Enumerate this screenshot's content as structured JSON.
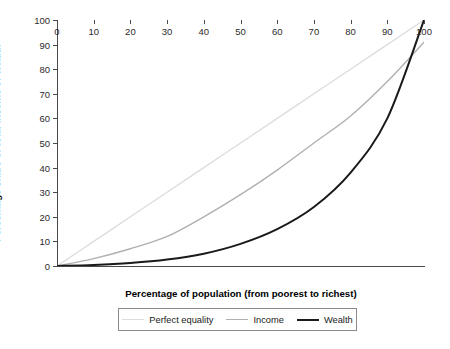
{
  "chart_data": {
    "type": "line",
    "title": "",
    "xlabel": "Percentage of population (from poorest to richest)",
    "ylabel": "Percentage share of total income or wealth",
    "xlim": [
      0,
      100
    ],
    "ylim": [
      0,
      100
    ],
    "xticks": [
      0,
      10,
      20,
      30,
      40,
      50,
      60,
      70,
      80,
      90,
      100
    ],
    "yticks": [
      0,
      10,
      20,
      30,
      40,
      50,
      60,
      70,
      80,
      90,
      100
    ],
    "grid": false,
    "legend_position": "below-axes",
    "x": [
      0,
      10,
      20,
      30,
      40,
      50,
      60,
      70,
      80,
      90,
      100
    ],
    "series": [
      {
        "name": "Perfect equality",
        "color": "#dcdcdc",
        "width": 1.3,
        "values": [
          0,
          10,
          20,
          30,
          40,
          50,
          60,
          70,
          80,
          90,
          100
        ]
      },
      {
        "name": "Income",
        "color": "#b0b0b0",
        "width": 1.4,
        "values": [
          0,
          3,
          7,
          12,
          20,
          29,
          39,
          50,
          61,
          75,
          91
        ]
      },
      {
        "name": "Wealth",
        "color": "#1a1a1a",
        "width": 2.0,
        "values": [
          0,
          0.4,
          1.2,
          2.6,
          5,
          9,
          15,
          24,
          38,
          60,
          100
        ]
      }
    ]
  },
  "axes": {
    "ylabel": "Percentage share of total income or wealth",
    "xlabel": "Percentage of population (from poorest to richest)",
    "ytick_labels": [
      "0",
      "10",
      "20",
      "30",
      "40",
      "50",
      "60",
      "70",
      "80",
      "90",
      "100"
    ],
    "xtick_labels": [
      "0",
      "10",
      "20",
      "30",
      "40",
      "50",
      "60",
      "70",
      "80",
      "90",
      "100"
    ]
  },
  "legend": {
    "items": [
      {
        "label": "Perfect equality",
        "color": "#dcdcdc",
        "thickness": "1.3px"
      },
      {
        "label": "Income",
        "color": "#b0b0b0",
        "thickness": "1.4px"
      },
      {
        "label": "Wealth",
        "color": "#1a1a1a",
        "thickness": "2.2px"
      }
    ]
  },
  "caption": {
    "text": ""
  }
}
